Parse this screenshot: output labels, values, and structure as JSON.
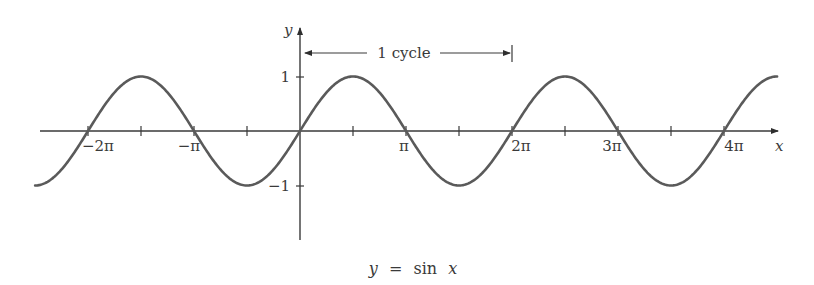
{
  "figure": {
    "caption": "y = sin x",
    "caption_parts": {
      "lhs": "y",
      "eq": "=",
      "fn": "sin",
      "arg": "x"
    },
    "axes": {
      "x_label": "x",
      "y_label": "y",
      "x_ticks": [
        "−2π",
        "−π",
        "π",
        "2π",
        "3π",
        "4π"
      ],
      "y_ticks": [
        "1",
        "−1"
      ]
    },
    "annotation": {
      "label": "1 cycle",
      "from": "0",
      "to": "2π"
    },
    "colors": {
      "curve": "#5a5a5a",
      "axes": "#3a3a3a",
      "background": "#ffffff"
    }
  },
  "chart_data": {
    "type": "line",
    "title": "y = sin x",
    "xlabel": "x",
    "ylabel": "y",
    "function": "sin(x)",
    "x_range": [
      "-2.5π",
      "4.5π"
    ],
    "xlim": [
      -7.85,
      14.14
    ],
    "ylim": [
      -1.5,
      1.9
    ],
    "x_tick_values": [
      -6.2832,
      -3.1416,
      3.1416,
      6.2832,
      9.4248,
      12.5664
    ],
    "x_tick_labels": [
      "−2π",
      "−π",
      "π",
      "2π",
      "3π",
      "4π"
    ],
    "minor_x_ticks": [
      "−3π/2",
      "−π/2",
      "π/2",
      "3π/2",
      "5π/2",
      "7π/2"
    ],
    "y_tick_values": [
      1,
      -1
    ],
    "y_tick_labels": [
      "1",
      "−1"
    ],
    "grid": false,
    "annotations": [
      {
        "text": "1 cycle",
        "x_start": 0,
        "x_end": 6.2832,
        "y": 1.45
      }
    ],
    "series": [
      {
        "name": "sin x",
        "x": [
          -7.854,
          -6.283,
          -4.712,
          -3.142,
          -1.571,
          0,
          1.571,
          3.142,
          4.712,
          6.283,
          7.854,
          9.425,
          10.996,
          12.566,
          14.137
        ],
        "values": [
          -1,
          0,
          1,
          0,
          -1,
          0,
          1,
          0,
          -1,
          0,
          1,
          0,
          -1,
          0,
          1
        ]
      }
    ]
  }
}
